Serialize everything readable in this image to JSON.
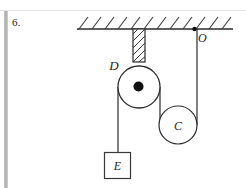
{
  "figure": {
    "question_number": "6.",
    "labels": {
      "pulley_large": "D",
      "pulley_small": "C",
      "block": "E",
      "anchor_point": "O"
    },
    "colors": {
      "ink": "#2b2b2b",
      "page": "#ffffff",
      "scan_edge": "#b0b0b0",
      "hatch": "#3a3a3a"
    },
    "geometry": {
      "ceiling": {
        "x1": 77,
        "x2": 233,
        "y": 29
      },
      "hatch_count": 12,
      "hatch_spacing": 13,
      "hanger_bar": {
        "x": 133,
        "y": 29,
        "width": 12,
        "height": 33
      },
      "pulley_large": {
        "cx": 139,
        "cy": 87,
        "r": 21,
        "hub_r": 5
      },
      "pulley_small": {
        "cx": 178,
        "cy": 125,
        "r": 19
      },
      "anchor_point": {
        "cx": 194,
        "cy": 29,
        "r": 2
      },
      "block": {
        "x": 104,
        "y": 152,
        "width": 26,
        "height": 26
      },
      "rope_left_x": 118,
      "rope_right_x": 160,
      "rope_anchor_x": 194
    }
  }
}
